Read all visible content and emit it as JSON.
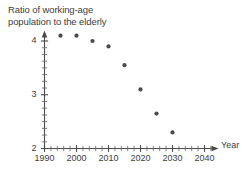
{
  "chart_data": {
    "type": "scatter",
    "title": "Ratio of working-age population to the elderly",
    "title_lines": [
      "Ratio of working-age",
      "population to the elderly"
    ],
    "xlabel": "Year",
    "ylabel": "",
    "xlim": [
      1990,
      2045
    ],
    "ylim": [
      2,
      4.25
    ],
    "x_ticks_major": [
      1990,
      2000,
      2010,
      2020,
      2030,
      2040
    ],
    "x_tick_labels": [
      "1990",
      "2000",
      "2010",
      "2020",
      "2030",
      "2040"
    ],
    "x_minor_tick_step": 2,
    "y_ticks_major": [
      2,
      3,
      4
    ],
    "y_tick_labels": [
      "2",
      "3",
      "4"
    ],
    "y_minor_tick_step": 0.125,
    "grid": false,
    "legend": null,
    "marker": "filled-circle",
    "marker_color": "#4a4a4a",
    "x": [
      1995,
      2000,
      2005,
      2010,
      2015,
      2020,
      2025,
      2030
    ],
    "values": [
      4.1,
      4.1,
      4.0,
      3.9,
      3.55,
      3.1,
      2.65,
      2.3
    ],
    "points": [
      {
        "x": 1995,
        "y": 4.1
      },
      {
        "x": 2000,
        "y": 4.1
      },
      {
        "x": 2005,
        "y": 4.0
      },
      {
        "x": 2010,
        "y": 3.9
      },
      {
        "x": 2015,
        "y": 3.55
      },
      {
        "x": 2020,
        "y": 3.1
      },
      {
        "x": 2025,
        "y": 2.65
      },
      {
        "x": 2030,
        "y": 2.3
      }
    ]
  }
}
